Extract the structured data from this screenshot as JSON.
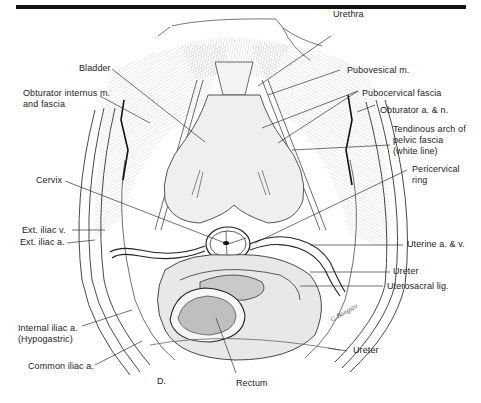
{
  "figure": {
    "panel_letter": "D.",
    "colors": {
      "ink": "#222222",
      "rule": "#111111",
      "paper": "#ffffff",
      "shade": "#d9d9d9"
    }
  },
  "labels": {
    "urethra": "Urethra",
    "bladder": "Bladder",
    "pubovesical": "Pubovesical m.",
    "obturator_internus_1": "Obturator internus m.",
    "obturator_internus_2": "and fascia",
    "pubocervical": "Pubocervical fascia",
    "obturator_an": "Obturator a. & n.",
    "tendinous_1": "Tendinous arch of",
    "tendinous_2": "pelvic fascia",
    "tendinous_3": "(white line)",
    "pericervical_1": "Pericervical",
    "pericervical_2": "ring",
    "cervix": "Cervix",
    "ext_iliac_v": "Ext. iliac v.",
    "ext_iliac_a": "Ext. iliac a.",
    "uterine": "Uterine a. & v.",
    "ureter_upper": "Ureter",
    "uterosacral": "Uterosacral lig.",
    "internal_iliac_1": "Internal iliac a.",
    "internal_iliac_2": "(Hypogastric)",
    "common_iliac": "Common iliac a.",
    "rectum": "Rectum",
    "ureter_lower": "Ureter"
  }
}
